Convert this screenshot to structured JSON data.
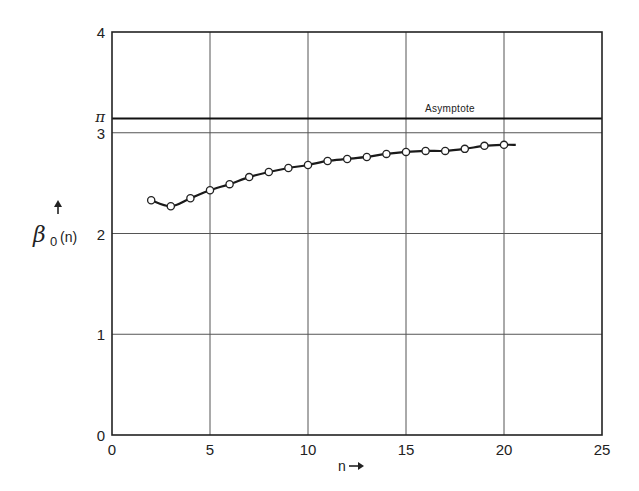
{
  "chart_data": {
    "type": "line",
    "title": "",
    "xlabel": "n",
    "xlabel_arrow": "→",
    "ylabel": "β0(n)",
    "ylabel_symbol": "β",
    "ylabel_subscript": "0",
    "ylabel_arg": "(n)",
    "ylabel_arrow": "↑",
    "xlim": [
      0,
      25
    ],
    "ylim": [
      0,
      4
    ],
    "xticks": [
      0,
      5,
      10,
      15,
      20,
      25
    ],
    "xtick_labels": [
      "0",
      "5",
      "10",
      "15",
      "20",
      "25"
    ],
    "yticks": [
      0,
      1,
      2,
      3,
      4
    ],
    "ytick_labels": [
      "0",
      "1",
      "2",
      "3",
      "4"
    ],
    "extra_ytick": {
      "value": 3.14159,
      "label": "π"
    },
    "grid": true,
    "legend": null,
    "series": [
      {
        "name": "β0(n)",
        "marker": "open-circle",
        "x": [
          2,
          3,
          4,
          5,
          6,
          7,
          8,
          9,
          10,
          11,
          12,
          13,
          14,
          15,
          16,
          17,
          18,
          19,
          20
        ],
        "values": [
          2.33,
          2.27,
          2.35,
          2.43,
          2.49,
          2.56,
          2.61,
          2.65,
          2.68,
          2.72,
          2.74,
          2.76,
          2.79,
          2.81,
          2.82,
          2.82,
          2.84,
          2.87,
          2.88
        ],
        "curve_extends_to_x": 20.6
      }
    ],
    "annotations": [
      {
        "text": "Asymptote",
        "type": "hline",
        "y": 3.14159
      }
    ]
  },
  "labels": {
    "asymptote": "Asymptote",
    "pi": "π",
    "x_axis": "n",
    "y_axis_beta": "β",
    "y_axis_sub": "0",
    "y_axis_arg": "(n)"
  },
  "colors": {
    "line": "#1a1a1a",
    "grid": "#555555",
    "marker_fill": "#ffffff"
  }
}
